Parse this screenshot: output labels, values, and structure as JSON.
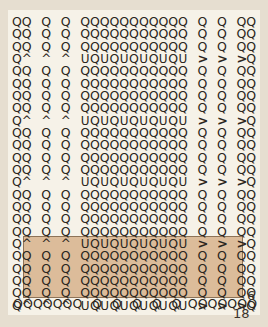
{
  "document": {
    "type": "stitch-chart",
    "title": "Crochet stitch chart",
    "background_color": "#efe9dc",
    "paper_color": "#f6f2e8",
    "symbol_color": "#2b2620",
    "repeat_box_color": "#dcbc9a",
    "repeat_box_border_color": "#8d7358"
  },
  "labels": {
    "row_count": "6",
    "stitch_count": "18"
  },
  "legend_symbols": {
    "Q": "chain-stitch-symbol",
    "U": "u-stitch-symbol",
    "^": "caret-stitch-symbol",
    ">": "greater-than-stitch-symbol",
    "": "empty-cell"
  },
  "chart_data": {
    "type": "table",
    "columns": 25,
    "rows": 24,
    "column_x": [
      0,
      14,
      28,
      42,
      56,
      70,
      84,
      98,
      112,
      126,
      140,
      154,
      168,
      182,
      196,
      210,
      224,
      238,
      252,
      266,
      280,
      294,
      308,
      322,
      336
    ],
    "repeat_box": {
      "start_row_index": 18,
      "end_row_index": 23,
      "rows_covered": 6,
      "label": "6"
    },
    "grid": [
      [
        "Q",
        "Q",
        "",
        "Q",
        "",
        "Q",
        "",
        "Q",
        "Q",
        "Q",
        "Q",
        "Q",
        "Q",
        "Q",
        "Q",
        "Q",
        "Q",
        "Q",
        "",
        "Q",
        "",
        "Q",
        "",
        "Q",
        "Q"
      ],
      [
        "Q",
        "Q",
        "",
        "Q",
        "",
        "Q",
        "",
        "Q",
        "Q",
        "Q",
        "Q",
        "Q",
        "Q",
        "Q",
        "Q",
        "Q",
        "Q",
        "Q",
        "",
        "Q",
        "",
        "Q",
        "",
        "Q",
        "Q"
      ],
      [
        "Q",
        "Q",
        "",
        "Q",
        "",
        "Q",
        "",
        "Q",
        "Q",
        "Q",
        "Q",
        "Q",
        "Q",
        "Q",
        "Q",
        "Q",
        "Q",
        "Q",
        "",
        "Q",
        "",
        "Q",
        "",
        "Q",
        "Q"
      ],
      [
        "Q",
        "^",
        "",
        "^",
        "",
        "^",
        "",
        "U",
        "Q",
        "U",
        "Q",
        "U",
        "Q",
        "U",
        "Q",
        "U",
        "Q",
        "U",
        "",
        ">",
        "",
        ">",
        "",
        ">",
        "Q"
      ],
      [
        "Q",
        "Q",
        "",
        "Q",
        "",
        "Q",
        "",
        "Q",
        "Q",
        "Q",
        "Q",
        "Q",
        "Q",
        "Q",
        "Q",
        "Q",
        "Q",
        "Q",
        "",
        "Q",
        "",
        "Q",
        "",
        "Q",
        "Q"
      ],
      [
        "Q",
        "Q",
        "",
        "Q",
        "",
        "Q",
        "",
        "Q",
        "Q",
        "Q",
        "Q",
        "Q",
        "Q",
        "Q",
        "Q",
        "Q",
        "Q",
        "Q",
        "",
        "Q",
        "",
        "Q",
        "",
        "Q",
        "Q"
      ],
      [
        "Q",
        "Q",
        "",
        "Q",
        "",
        "Q",
        "",
        "Q",
        "Q",
        "Q",
        "Q",
        "Q",
        "Q",
        "Q",
        "Q",
        "Q",
        "Q",
        "Q",
        "",
        "Q",
        "",
        "Q",
        "",
        "Q",
        "Q"
      ],
      [
        "Q",
        "Q",
        "",
        "Q",
        "",
        "Q",
        "",
        "Q",
        "Q",
        "Q",
        "Q",
        "Q",
        "Q",
        "Q",
        "Q",
        "Q",
        "Q",
        "Q",
        "",
        "Q",
        "",
        "Q",
        "",
        "Q",
        "Q"
      ],
      [
        "Q",
        "^",
        "",
        "^",
        "",
        "^",
        "",
        "U",
        "Q",
        "U",
        "Q",
        "U",
        "Q",
        "U",
        "Q",
        "U",
        "Q",
        "U",
        "",
        ">",
        "",
        ">",
        "",
        ">",
        "Q"
      ],
      [
        "Q",
        "Q",
        "",
        "Q",
        "",
        "Q",
        "",
        "Q",
        "Q",
        "Q",
        "Q",
        "Q",
        "Q",
        "Q",
        "Q",
        "Q",
        "Q",
        "Q",
        "",
        "Q",
        "",
        "Q",
        "",
        "Q",
        "Q"
      ],
      [
        "Q",
        "Q",
        "",
        "Q",
        "",
        "Q",
        "",
        "Q",
        "Q",
        "Q",
        "Q",
        "Q",
        "Q",
        "Q",
        "Q",
        "Q",
        "Q",
        "Q",
        "",
        "Q",
        "",
        "Q",
        "",
        "Q",
        "Q"
      ],
      [
        "Q",
        "Q",
        "",
        "Q",
        "",
        "Q",
        "",
        "Q",
        "Q",
        "Q",
        "Q",
        "Q",
        "Q",
        "Q",
        "Q",
        "Q",
        "Q",
        "Q",
        "",
        "Q",
        "",
        "Q",
        "",
        "Q",
        "Q"
      ],
      [
        "Q",
        "Q",
        "",
        "Q",
        "",
        "Q",
        "",
        "Q",
        "Q",
        "Q",
        "Q",
        "Q",
        "Q",
        "Q",
        "Q",
        "Q",
        "Q",
        "Q",
        "",
        "Q",
        "",
        "Q",
        "",
        "Q",
        "Q"
      ],
      [
        "Q",
        "^",
        "",
        "^",
        "",
        "^",
        "",
        "U",
        "Q",
        "U",
        "Q",
        "U",
        "Q",
        "U",
        "Q",
        "U",
        "Q",
        "U",
        "",
        ">",
        "",
        ">",
        "",
        ">",
        "Q"
      ],
      [
        "Q",
        "Q",
        "",
        "Q",
        "",
        "Q",
        "",
        "Q",
        "Q",
        "Q",
        "Q",
        "Q",
        "Q",
        "Q",
        "Q",
        "Q",
        "Q",
        "Q",
        "",
        "Q",
        "",
        "Q",
        "",
        "Q",
        "Q"
      ],
      [
        "Q",
        "Q",
        "",
        "Q",
        "",
        "Q",
        "",
        "Q",
        "Q",
        "Q",
        "Q",
        "Q",
        "Q",
        "Q",
        "Q",
        "Q",
        "Q",
        "Q",
        "",
        "Q",
        "",
        "Q",
        "",
        "Q",
        "Q"
      ],
      [
        "Q",
        "Q",
        "",
        "Q",
        "",
        "Q",
        "",
        "Q",
        "Q",
        "Q",
        "Q",
        "Q",
        "Q",
        "Q",
        "Q",
        "Q",
        "Q",
        "Q",
        "",
        "Q",
        "",
        "Q",
        "",
        "Q",
        "Q"
      ],
      [
        "Q",
        "Q",
        "",
        "Q",
        "",
        "Q",
        "",
        "Q",
        "Q",
        "Q",
        "Q",
        "Q",
        "Q",
        "Q",
        "Q",
        "Q",
        "Q",
        "Q",
        "",
        "Q",
        "",
        "Q",
        "",
        "Q",
        "Q"
      ],
      [
        "Q",
        "^",
        "",
        "^",
        "",
        "^",
        "",
        "U",
        "Q",
        "U",
        "Q",
        "U",
        "Q",
        "U",
        "Q",
        "U",
        "Q",
        "U",
        "",
        ">",
        "",
        ">",
        "",
        ">",
        "Q"
      ],
      [
        "Q",
        "Q",
        "",
        "Q",
        "",
        "Q",
        "",
        "Q",
        "Q",
        "Q",
        "Q",
        "Q",
        "Q",
        "Q",
        "Q",
        "Q",
        "Q",
        "Q",
        "",
        "Q",
        "",
        "Q",
        "",
        "Q",
        "Q"
      ],
      [
        "Q",
        "Q",
        "",
        "Q",
        "",
        "Q",
        "",
        "Q",
        "Q",
        "Q",
        "Q",
        "Q",
        "Q",
        "Q",
        "Q",
        "Q",
        "Q",
        "Q",
        "",
        "Q",
        "",
        "Q",
        "",
        "Q",
        "Q"
      ],
      [
        "Q",
        "Q",
        "",
        "Q",
        "",
        "Q",
        "",
        "Q",
        "Q",
        "Q",
        "Q",
        "Q",
        "Q",
        "Q",
        "Q",
        "Q",
        "Q",
        "Q",
        "",
        "Q",
        "",
        "Q",
        "",
        "Q",
        "Q"
      ],
      [
        "Q",
        "Q",
        "",
        "Q",
        "",
        "Q",
        "",
        "Q",
        "Q",
        "Q",
        "Q",
        "Q",
        "Q",
        "Q",
        "Q",
        "Q",
        "Q",
        "Q",
        "",
        "Q",
        "",
        "Q",
        "",
        "Q",
        "Q"
      ],
      [
        "Q",
        "^",
        "",
        "^",
        "",
        "^",
        "",
        "U",
        "Q",
        "U",
        "Q",
        "U",
        "Q",
        "U",
        "Q",
        "U",
        "Q",
        "U",
        "",
        ">",
        "",
        ">",
        "",
        ">",
        "Q"
      ]
    ],
    "foundation_row": {
      "symbols": [
        "Q",
        "Q",
        "Q",
        "Q",
        "Q",
        "Q",
        "Q",
        "Q",
        "Q",
        "Q",
        "Q",
        "Q",
        "Q",
        "Q",
        "Q",
        "Q",
        "Q",
        "Q",
        "Q"
      ],
      "x_positions": [
        0,
        11,
        22,
        33,
        44,
        55,
        66,
        88,
        110,
        132,
        154,
        176,
        194,
        205,
        216,
        227,
        238,
        249,
        260
      ]
    }
  }
}
